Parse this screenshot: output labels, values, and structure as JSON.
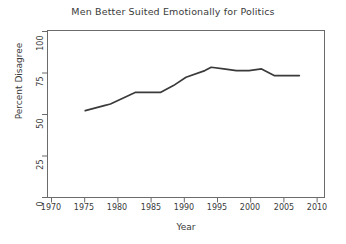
{
  "chart_data": {
    "type": "line",
    "title": "Men Better Suited Emotionally for Politics",
    "xlabel": "Year",
    "ylabel": "Percent Disagree",
    "xlim": [
      1968,
      2012
    ],
    "ylim": [
      0,
      100
    ],
    "xticks": [
      1970,
      1975,
      1980,
      1985,
      1990,
      1995,
      2000,
      2005,
      2010
    ],
    "yticks": [
      0,
      25,
      50,
      75,
      100
    ],
    "grid": false,
    "legend": null,
    "line_color": "#3a3a3a",
    "x": [
      1974,
      1977,
      1978,
      1982,
      1983,
      1986,
      1988,
      1990,
      1993,
      1994,
      1996,
      1998,
      2000,
      2002,
      2004,
      2006,
      2008
    ],
    "values": [
      52,
      55,
      56,
      63,
      63,
      63,
      67,
      72,
      76,
      78,
      77,
      76,
      76,
      77,
      73,
      73,
      73
    ],
    "series": [
      {
        "name": "Percent Disagree",
        "values": [
          52,
          55,
          56,
          63,
          63,
          63,
          67,
          72,
          76,
          78,
          77,
          76,
          76,
          77,
          73,
          73,
          73
        ]
      }
    ]
  }
}
